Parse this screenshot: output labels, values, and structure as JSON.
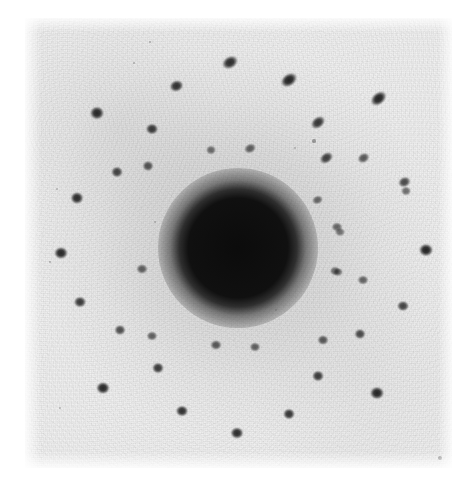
{
  "image": {
    "kind": "electron-diffraction-pattern-photograph",
    "width": 475,
    "height": 482,
    "background_color": "#ffffff",
    "plate": {
      "x": 25,
      "y": 18,
      "width": 427,
      "height": 450,
      "base_tone": "#f0f0f0",
      "emulsion_tone": "#e6e6e6"
    },
    "central_beam": {
      "label": "direct-beam-disc",
      "cx": 238,
      "cy": 248,
      "core_radius": 40,
      "halo_radius": 80,
      "core_color": "#080808"
    },
    "colors": {
      "spot_dark": "#1b1b1b",
      "spot_mid": "#3d3d3d",
      "spot_faint": "#6e6e6e",
      "paper_white": "#ffffff",
      "film_gray": "#ececec"
    }
  },
  "chart_data": {
    "type": "scatter",
    "title": "",
    "subtitle": "",
    "xlabel": "",
    "ylabel": "",
    "grid": false,
    "legend": null,
    "xlim": [
      25,
      452
    ],
    "ylim": [
      18,
      468
    ],
    "annotations": [],
    "center": {
      "x": 238,
      "y": 248
    },
    "spots": [
      {
        "x": 230,
        "y": 62,
        "r": 7.0,
        "i": 0.86,
        "rot": -30,
        "ar": 1.35
      },
      {
        "x": 289,
        "y": 80,
        "r": 7.2,
        "i": 0.9,
        "rot": -35,
        "ar": 1.4
      },
      {
        "x": 176,
        "y": 86,
        "r": 6.6,
        "i": 0.84,
        "rot": -20,
        "ar": 1.2
      },
      {
        "x": 379,
        "y": 98,
        "r": 7.0,
        "i": 0.9,
        "rot": -40,
        "ar": 1.45
      },
      {
        "x": 97,
        "y": 113,
        "r": 7.4,
        "i": 0.88,
        "rot": 0,
        "ar": 1.1
      },
      {
        "x": 318,
        "y": 122,
        "r": 6.4,
        "i": 0.82,
        "rot": -38,
        "ar": 1.4
      },
      {
        "x": 152,
        "y": 129,
        "r": 6.4,
        "i": 0.8,
        "rot": 0,
        "ar": 1.12
      },
      {
        "x": 250,
        "y": 148,
        "r": 5.4,
        "i": 0.62,
        "rot": -25,
        "ar": 1.3
      },
      {
        "x": 211,
        "y": 150,
        "r": 5.2,
        "i": 0.55,
        "rot": 0,
        "ar": 1.15
      },
      {
        "x": 326,
        "y": 158,
        "r": 6.0,
        "i": 0.78,
        "rot": -35,
        "ar": 1.35
      },
      {
        "x": 363,
        "y": 158,
        "r": 5.6,
        "i": 0.66,
        "rot": -30,
        "ar": 1.28
      },
      {
        "x": 117,
        "y": 172,
        "r": 6.2,
        "i": 0.76,
        "rot": 0,
        "ar": 1.1
      },
      {
        "x": 148,
        "y": 166,
        "r": 5.8,
        "i": 0.68,
        "rot": 0,
        "ar": 1.1
      },
      {
        "x": 405,
        "y": 182,
        "r": 6.0,
        "i": 0.72,
        "rot": -25,
        "ar": 1.22
      },
      {
        "x": 406,
        "y": 191,
        "r": 5.2,
        "i": 0.56,
        "rot": 0,
        "ar": 1.15
      },
      {
        "x": 317,
        "y": 200,
        "r": 5.0,
        "i": 0.58,
        "rot": -20,
        "ar": 1.25
      },
      {
        "x": 77,
        "y": 198,
        "r": 6.8,
        "i": 0.86,
        "rot": 0,
        "ar": 1.1
      },
      {
        "x": 337,
        "y": 227,
        "r": 5.2,
        "i": 0.58,
        "rot": 0,
        "ar": 1.18
      },
      {
        "x": 340,
        "y": 232,
        "r": 5.0,
        "i": 0.52,
        "rot": 0,
        "ar": 1.15
      },
      {
        "x": 61,
        "y": 253,
        "r": 7.0,
        "i": 0.88,
        "rot": 0,
        "ar": 1.12
      },
      {
        "x": 426,
        "y": 250,
        "r": 7.2,
        "i": 0.9,
        "rot": 0,
        "ar": 1.1
      },
      {
        "x": 142,
        "y": 269,
        "r": 5.6,
        "i": 0.62,
        "rot": 0,
        "ar": 1.15
      },
      {
        "x": 335,
        "y": 271,
        "r": 5.2,
        "i": 0.58,
        "rot": 0,
        "ar": 1.15
      },
      {
        "x": 338,
        "y": 272,
        "r": 5.0,
        "i": 0.54,
        "rot": 0,
        "ar": 1.12
      },
      {
        "x": 80,
        "y": 302,
        "r": 6.4,
        "i": 0.8,
        "rot": 0,
        "ar": 1.1
      },
      {
        "x": 363,
        "y": 280,
        "r": 5.4,
        "i": 0.6,
        "rot": 0,
        "ar": 1.18
      },
      {
        "x": 403,
        "y": 306,
        "r": 6.0,
        "i": 0.76,
        "rot": 0,
        "ar": 1.12
      },
      {
        "x": 120,
        "y": 330,
        "r": 5.8,
        "i": 0.7,
        "rot": 0,
        "ar": 1.12
      },
      {
        "x": 152,
        "y": 336,
        "r": 5.4,
        "i": 0.62,
        "rot": 0,
        "ar": 1.15
      },
      {
        "x": 216,
        "y": 345,
        "r": 5.6,
        "i": 0.66,
        "rot": 0,
        "ar": 1.15
      },
      {
        "x": 255,
        "y": 347,
        "r": 5.4,
        "i": 0.62,
        "rot": 0,
        "ar": 1.15
      },
      {
        "x": 323,
        "y": 340,
        "r": 5.6,
        "i": 0.66,
        "rot": 0,
        "ar": 1.12
      },
      {
        "x": 360,
        "y": 334,
        "r": 5.8,
        "i": 0.72,
        "rot": 0,
        "ar": 1.12
      },
      {
        "x": 158,
        "y": 368,
        "r": 6.2,
        "i": 0.8,
        "rot": 0,
        "ar": 1.1
      },
      {
        "x": 318,
        "y": 376,
        "r": 6.2,
        "i": 0.8,
        "rot": 0,
        "ar": 1.1
      },
      {
        "x": 103,
        "y": 388,
        "r": 7.0,
        "i": 0.88,
        "rot": 0,
        "ar": 1.1
      },
      {
        "x": 377,
        "y": 393,
        "r": 7.2,
        "i": 0.9,
        "rot": 0,
        "ar": 1.1
      },
      {
        "x": 182,
        "y": 411,
        "r": 6.4,
        "i": 0.84,
        "rot": 0,
        "ar": 1.1
      },
      {
        "x": 289,
        "y": 414,
        "r": 6.2,
        "i": 0.82,
        "rot": 0,
        "ar": 1.1
      },
      {
        "x": 237,
        "y": 433,
        "r": 6.6,
        "i": 0.86,
        "rot": 0,
        "ar": 1.1
      }
    ],
    "specks": [
      {
        "x": 150,
        "y": 42,
        "r": 1.4,
        "i": 0.35
      },
      {
        "x": 134,
        "y": 63,
        "r": 1.2,
        "i": 0.3
      },
      {
        "x": 314,
        "y": 141,
        "r": 1.6,
        "i": 0.4
      },
      {
        "x": 295,
        "y": 148,
        "r": 1.3,
        "i": 0.3
      },
      {
        "x": 57,
        "y": 189,
        "r": 1.3,
        "i": 0.28
      },
      {
        "x": 50,
        "y": 262,
        "r": 1.4,
        "i": 0.32
      },
      {
        "x": 60,
        "y": 408,
        "r": 1.3,
        "i": 0.28
      },
      {
        "x": 440,
        "y": 458,
        "r": 2.0,
        "i": 0.48
      },
      {
        "x": 155,
        "y": 222,
        "r": 1.2,
        "i": 0.26
      },
      {
        "x": 276,
        "y": 310,
        "r": 1.3,
        "i": 0.26
      }
    ]
  }
}
